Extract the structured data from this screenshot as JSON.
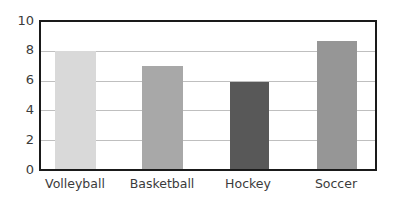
{
  "chart_data": {
    "type": "bar",
    "title": "",
    "subtitle": "",
    "xlabel": "",
    "ylabel": "",
    "categories": [
      "Volleyball",
      "Basketball",
      "Hockey",
      "Soccer"
    ],
    "values": [
      8.0,
      7.0,
      5.9,
      8.7
    ],
    "series": [
      {
        "name": "",
        "values": [
          8.0,
          7.0,
          5.9,
          8.7
        ]
      }
    ],
    "bar_colors": [
      "#d9d9d9",
      "#a8a8a8",
      "#585858",
      "#969696"
    ],
    "ylim": [
      0,
      10
    ],
    "y_ticks": [
      0,
      2,
      4,
      6,
      8,
      10
    ],
    "y_tick_labels": [
      "0",
      "2",
      "4",
      "6",
      "8",
      "10"
    ],
    "x_tick_labels": [
      "Volleyball",
      "Basketball",
      "Hockey",
      "Soccer"
    ],
    "grid": true,
    "grid_axis": "y",
    "gridline_color": "#bfbfbf",
    "legend": false,
    "legend_position": "none",
    "legend_entries": [],
    "annotations": [],
    "plot_border_color": "#1a1a1a",
    "background_color": "#ffffff"
  }
}
